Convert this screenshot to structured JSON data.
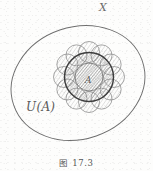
{
  "figure": {
    "caption": "图 17.3",
    "background_color": "#fdfdfc",
    "ink_color": "#5a5a5a",
    "labels": {
      "universe": "X",
      "neighborhood": "U(A)",
      "subset": "A"
    },
    "geometry": {
      "universe_ellipse": {
        "cx": 78,
        "cy": 83,
        "rx": 68,
        "ry": 56,
        "rotation_deg": -19,
        "stroke": "#6e6e6e",
        "stroke_width": 0.9
      },
      "neighborhood_flower": {
        "cx": 89,
        "cy": 77,
        "petal_count": 12,
        "petal_orbit_radius": 25,
        "petal_radius": 10.5,
        "stroke": "#808080",
        "stroke_width": 0.8,
        "hatch": true
      },
      "subset_circle": {
        "cx": 89,
        "cy": 77,
        "r": 24.5,
        "stroke": "#3d3d3d",
        "stroke_width": 1.5,
        "hatch": true
      },
      "inner_circle": {
        "cx": 89,
        "cy": 77,
        "r": 14,
        "stroke": "#666666",
        "stroke_width": 0.9,
        "hatch": true
      }
    }
  }
}
